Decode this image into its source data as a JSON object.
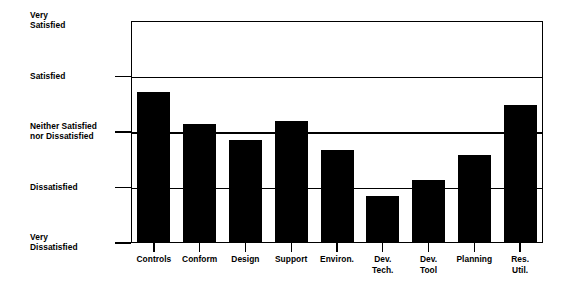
{
  "chart_data": {
    "type": "bar",
    "title": "",
    "subtitle": "",
    "xlabel": "",
    "ylabel": "",
    "orientation": "vertical",
    "grid": true,
    "legend": false,
    "bar_color": "#000000",
    "axis_color": "#000000",
    "background": "#ffffff",
    "ylim": [
      1,
      5
    ],
    "ytick_values": [
      5,
      4,
      3,
      2,
      1
    ],
    "ytick_labels": [
      "Very\nSatisfied",
      "Satisfied",
      "Neither Satisfied\nnor Dissatisfied",
      "Dissatisfied",
      "Very\nDissatisfied"
    ],
    "ytick_labels_flat": [
      "Very Satisfied",
      "Satisfied",
      "Neither Satisfied nor Dissatisfied",
      "Dissatisfied",
      "Very Dissatisfied"
    ],
    "categories": [
      "Controls",
      "Conform",
      "Design",
      "Support",
      "Environ.",
      "Dev.\nTech.",
      "Dev.\nTool",
      "Planning",
      "Res.\nUtil."
    ],
    "categories_flat": [
      "Controls",
      "Conform",
      "Design",
      "Support",
      "Environ.",
      "Dev. Tech.",
      "Dev. Tool",
      "Planning",
      "Res. Util."
    ],
    "values": [
      3.73,
      3.14,
      2.85,
      3.2,
      2.67,
      1.84,
      2.14,
      2.58,
      3.48
    ]
  },
  "y_axis": {
    "ticks": [
      {
        "label_line1": "Very",
        "label_line2": "Satisfied",
        "value": 5,
        "has_tick_mark": false
      },
      {
        "label_line1": "Satisfied",
        "label_line2": "",
        "value": 4,
        "has_tick_mark": true
      },
      {
        "label_line1": "Neither Satisfied",
        "label_line2": "nor Dissatisfied",
        "value": 3,
        "has_tick_mark": true
      },
      {
        "label_line1": "Dissatisfied",
        "label_line2": "",
        "value": 2,
        "has_tick_mark": true
      },
      {
        "label_line1": "Very",
        "label_line2": "Dissatisfied",
        "value": 1,
        "has_tick_mark": true
      }
    ]
  },
  "x_axis": {
    "ticks": [
      {
        "label_line1": "Controls",
        "label_line2": ""
      },
      {
        "label_line1": "Conform",
        "label_line2": ""
      },
      {
        "label_line1": "Design",
        "label_line2": ""
      },
      {
        "label_line1": "Support",
        "label_line2": ""
      },
      {
        "label_line1": "Environ.",
        "label_line2": ""
      },
      {
        "label_line1": "Dev.",
        "label_line2": "Tech."
      },
      {
        "label_line1": "Dev.",
        "label_line2": "Tool"
      },
      {
        "label_line1": "Planning",
        "label_line2": ""
      },
      {
        "label_line1": "Res.",
        "label_line2": "Util."
      }
    ]
  }
}
